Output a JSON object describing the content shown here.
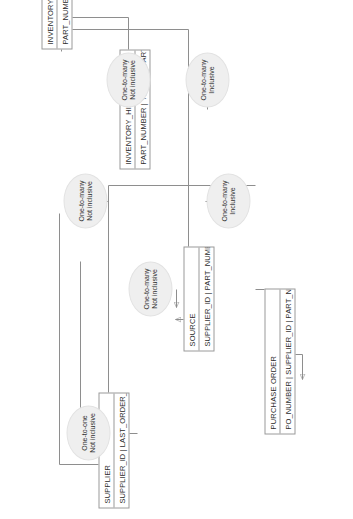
{
  "diagram": {
    "type": "entity-relationship-diagram",
    "orientation": "rotated-90-counterclockwise",
    "background_color": "#ffffff",
    "line_color": "#8e8e8e",
    "entity_fill": "#ffffff",
    "relationship_fill": "#efefef",
    "entities": [
      {
        "id": "supplier",
        "name": "SUPPLIER",
        "attributes": "SUPPLIER_ID | LAST_ORDER_NUMBER | ..............."
      },
      {
        "id": "inventory",
        "name": "INVENTORY",
        "attributes": "PART_NUMBER | ENG_DRAWING_NUM | .............."
      },
      {
        "id": "inventory_history",
        "name": "INVENTORY_HISTORY",
        "attributes": "PART_NUMBER | YEAR | QUARTER | ..............."
      },
      {
        "id": "source",
        "name": "SOURCE",
        "attributes": "SUPPLIER_ID | PART_NUMBER | .............."
      },
      {
        "id": "purchase_order",
        "name": "PURCHASE ORDER",
        "attributes": "PO_NUMBER | SUPPLIER_ID | PART_NUMBER | .............."
      }
    ],
    "relationships": [
      {
        "id": "rel-supplier-last-order",
        "line1": "One-to-one",
        "line2": "Not inclusive"
      },
      {
        "id": "rel-inventory-history",
        "line1": "One-to-many",
        "line2": "Not inclusive"
      },
      {
        "id": "rel-inventory-history-quarter",
        "line1": "One-to-many",
        "line2": "Inclusive"
      },
      {
        "id": "rel-source-part",
        "line1": "One-to-many",
        "line2": "Inclusive"
      },
      {
        "id": "rel-supplier-source",
        "line1": "One-to-many",
        "line2": "Not inclusive"
      },
      {
        "id": "rel-purchase-order-part",
        "line1": "One-to-many",
        "line2": "Not inclusive"
      }
    ]
  }
}
